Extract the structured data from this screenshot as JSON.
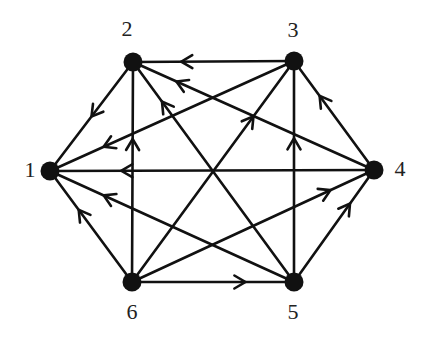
{
  "diagram": {
    "type": "directed-graph",
    "colors": {
      "stroke": "#111111",
      "node": "#111111",
      "label": "#222222",
      "background": "#ffffff"
    },
    "nodes": [
      {
        "id": "1",
        "label": "1",
        "x": 50,
        "y": 171,
        "label_x": 30,
        "label_y": 172
      },
      {
        "id": "2",
        "label": "2",
        "x": 133,
        "y": 62,
        "label_x": 127,
        "label_y": 31
      },
      {
        "id": "3",
        "label": "3",
        "x": 294,
        "y": 61,
        "label_x": 293,
        "label_y": 32
      },
      {
        "id": "4",
        "label": "4",
        "x": 374,
        "y": 170,
        "label_x": 400,
        "label_y": 171
      },
      {
        "id": "5",
        "label": "5",
        "x": 294,
        "y": 282,
        "label_x": 293,
        "label_y": 314
      },
      {
        "id": "6",
        "label": "6",
        "x": 132,
        "y": 282,
        "label_x": 132,
        "label_y": 314
      }
    ],
    "edges": [
      {
        "from": "2",
        "to": "1",
        "arrow_t": 0.5
      },
      {
        "from": "3",
        "to": "1",
        "arrow_t": 0.78
      },
      {
        "from": "4",
        "to": "1",
        "arrow_t": 0.78
      },
      {
        "from": "5",
        "to": "1",
        "arrow_t": 0.78
      },
      {
        "from": "6",
        "to": "1",
        "arrow_t": 0.65
      },
      {
        "from": "3",
        "to": "2",
        "arrow_t": 0.7
      },
      {
        "from": "4",
        "to": "2",
        "arrow_t": 0.82
      },
      {
        "from": "5",
        "to": "2",
        "arrow_t": 0.82
      },
      {
        "from": "6",
        "to": "2",
        "arrow_t": 0.65
      },
      {
        "from": "4",
        "to": "3",
        "arrow_t": 0.68
      },
      {
        "from": "5",
        "to": "3",
        "arrow_t": 0.65
      },
      {
        "from": "6",
        "to": "3",
        "arrow_t": 0.75
      },
      {
        "from": "5",
        "to": "4",
        "arrow_t": 0.7
      },
      {
        "from": "6",
        "to": "4",
        "arrow_t": 0.82
      },
      {
        "from": "6",
        "to": "5",
        "arrow_t": 0.7
      }
    ]
  }
}
